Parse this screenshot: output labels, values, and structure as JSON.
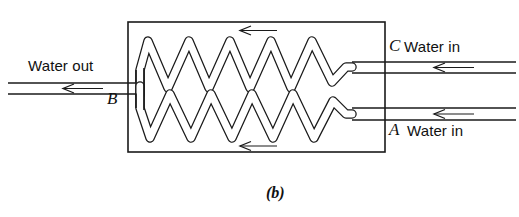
{
  "figure": {
    "caption": "(b)",
    "title": "",
    "background_color": "#ffffff",
    "line_color": "#1a1a1a"
  },
  "labels": {
    "water_out": "Water out",
    "water_in_top": "Water in",
    "water_in_bottom": "Water in",
    "point_a": "A",
    "point_b": "B",
    "point_c": "C"
  },
  "diagram_data": {
    "type": "schematic",
    "subject": "counter-flow heat exchanger with two helical coil tubes inside a rectangular shell",
    "shell": {
      "x": 128,
      "y": 22,
      "width": 257,
      "height": 130
    },
    "ports": [
      {
        "id": "A",
        "label": "Water in",
        "side": "right",
        "position": "bottom",
        "flow_direction": "left",
        "y": 114
      },
      {
        "id": "C",
        "label": "Water in",
        "side": "right",
        "position": "top",
        "flow_direction": "left",
        "y": 67
      },
      {
        "id": "B",
        "label": "Water out",
        "side": "left",
        "position": "middle",
        "flow_direction": "left",
        "y": 88
      }
    ],
    "coils": [
      {
        "id": "upper-coil",
        "peaks": 5,
        "top_y": 38,
        "bottom_y": 88,
        "x_start": 146,
        "x_end": 352
      },
      {
        "id": "lower-coil",
        "peaks": 5,
        "top_y": 92,
        "bottom_y": 141,
        "x_start": 146,
        "x_end": 352
      }
    ],
    "flow_arrows": [
      {
        "id": "shell-flow-top",
        "direction": "left",
        "x_from": 277,
        "x_to": 240,
        "y": 30
      },
      {
        "id": "shell-flow-bottom",
        "direction": "left",
        "x_from": 277,
        "x_to": 240,
        "y": 146
      },
      {
        "id": "outlet-flow",
        "direction": "left",
        "x_from": 103,
        "x_to": 63,
        "y": 88
      },
      {
        "id": "inlet-flow-top",
        "direction": "left",
        "x_from": 474,
        "x_to": 434,
        "y": 67
      },
      {
        "id": "inlet-flow-bottom",
        "direction": "left",
        "x_from": 474,
        "x_to": 434,
        "y": 114
      }
    ]
  }
}
